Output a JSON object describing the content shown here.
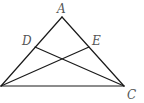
{
  "diagram": {
    "type": "geometry-triangle",
    "points": {
      "A": {
        "label": "A",
        "x": 62,
        "y": 17,
        "label_x": 57,
        "label_y": 13
      },
      "B": {
        "label": "",
        "x": 1,
        "y": 86
      },
      "C": {
        "label": "C",
        "x": 124,
        "y": 86,
        "label_x": 127,
        "label_y": 99
      },
      "D": {
        "label": "D",
        "x": 35,
        "y": 47,
        "label_x": 22,
        "label_y": 45
      },
      "E": {
        "label": "E",
        "x": 89,
        "y": 47,
        "label_x": 92,
        "label_y": 45
      }
    },
    "segments": [
      {
        "from": "A",
        "to": "B"
      },
      {
        "from": "A",
        "to": "C"
      },
      {
        "from": "B",
        "to": "C"
      },
      {
        "from": "D",
        "to": "C"
      },
      {
        "from": "E",
        "to": "B"
      }
    ],
    "colors": {
      "line": "#1a1a1a",
      "label": "#555555",
      "background": "#ffffff"
    }
  }
}
